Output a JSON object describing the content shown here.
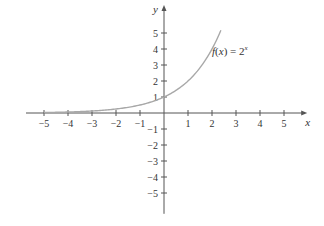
{
  "chart_data": {
    "type": "line",
    "title": "",
    "xlabel": "x",
    "ylabel": "y",
    "xlim": [
      -5.5,
      5.8
    ],
    "ylim": [
      -6.3,
      6.5
    ],
    "x_ticks": [
      -5,
      -4,
      -3,
      -2,
      -1,
      1,
      2,
      3,
      4,
      5
    ],
    "y_ticks": [
      -5,
      -4,
      -3,
      -2,
      -1,
      1,
      2,
      3,
      4,
      5
    ],
    "x_tick_labels": [
      "−5",
      "−4",
      "−3",
      "−2",
      "−1",
      "1",
      "2",
      "3",
      "4",
      "5"
    ],
    "y_tick_labels": [
      "−5",
      "−4",
      "−3",
      "−2",
      "−1",
      "1",
      "2",
      "3",
      "4",
      "5"
    ],
    "grid": false,
    "series": [
      {
        "name": "f(x) = 2^x",
        "function": "2^x",
        "x_range": [
          -5,
          2.37
        ],
        "x": [
          -5,
          -4,
          -3,
          -2,
          -1,
          0,
          1,
          2,
          2.37
        ],
        "y": [
          0.03125,
          0.0625,
          0.125,
          0.25,
          0.5,
          1,
          2,
          4,
          5.17
        ],
        "color": "#a0a0a0"
      }
    ],
    "annotations": [
      {
        "text_main": "f(x) = 2",
        "text_sup": "x",
        "x": 2.0,
        "y": 3.6
      }
    ]
  },
  "style": {
    "axis_color": "#555555",
    "curve_color": "#a8a8a8",
    "text_color": "#333333"
  },
  "layout": {
    "origin_px": [
      164,
      113
    ],
    "unit_x_px": 24,
    "unit_y_px": 16
  }
}
